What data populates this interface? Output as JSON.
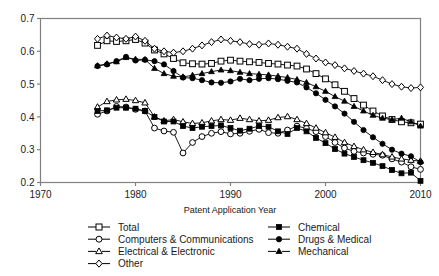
{
  "chart_data": {
    "type": "line",
    "title": "",
    "xlabel": "Patent Application Year",
    "ylabel": "",
    "xlim": [
      1970,
      2010
    ],
    "ylim": [
      0.2,
      0.7
    ],
    "xticks": [
      1970,
      1980,
      1990,
      2000,
      2010
    ],
    "yticks": [
      0.2,
      0.3,
      0.4,
      0.5,
      0.6,
      0.7
    ],
    "xtick_labels": [
      "1970",
      "1980",
      "1990",
      "2000",
      "2010"
    ],
    "ytick_labels": [
      "0.2",
      "0.3",
      "0.4",
      "0.5",
      "0.6",
      "0.7"
    ],
    "grid": false,
    "legend_position": "below",
    "x": [
      1976,
      1977,
      1978,
      1979,
      1980,
      1981,
      1982,
      1983,
      1984,
      1985,
      1986,
      1987,
      1988,
      1989,
      1990,
      1991,
      1992,
      1993,
      1994,
      1995,
      1996,
      1997,
      1998,
      1999,
      2000,
      2001,
      2002,
      2003,
      2004,
      2005,
      2006,
      2007,
      2008,
      2009,
      2010
    ],
    "series": [
      {
        "name": "Total",
        "marker": "open-square",
        "values": [
          0.618,
          0.632,
          0.63,
          0.632,
          0.636,
          0.625,
          0.604,
          0.592,
          0.578,
          0.565,
          0.562,
          0.561,
          0.563,
          0.57,
          0.573,
          0.57,
          0.568,
          0.566,
          0.563,
          0.561,
          0.558,
          0.555,
          0.546,
          0.532,
          0.516,
          0.498,
          0.478,
          0.456,
          0.436,
          0.418,
          0.403,
          0.392,
          0.385,
          0.382,
          0.378
        ]
      },
      {
        "name": "Computers & Communications",
        "marker": "open-circle",
        "values": [
          0.408,
          0.418,
          0.432,
          0.43,
          0.423,
          0.418,
          0.366,
          0.357,
          0.353,
          0.29,
          0.322,
          0.34,
          0.35,
          0.355,
          0.348,
          0.35,
          0.356,
          0.362,
          0.352,
          0.35,
          0.36,
          0.372,
          0.365,
          0.355,
          0.34,
          0.322,
          0.305,
          0.295,
          0.29,
          0.286,
          0.283,
          0.272,
          0.262,
          0.248,
          0.24
        ]
      },
      {
        "name": "Electrical & Electronic",
        "marker": "open-triangle",
        "values": [
          0.43,
          0.447,
          0.452,
          0.454,
          0.45,
          0.443,
          0.4,
          0.388,
          0.392,
          0.385,
          0.38,
          0.382,
          0.388,
          0.392,
          0.39,
          0.396,
          0.392,
          0.388,
          0.39,
          0.398,
          0.401,
          0.392,
          0.38,
          0.366,
          0.352,
          0.338,
          0.322,
          0.31,
          0.3,
          0.292,
          0.285,
          0.278,
          0.272,
          0.268,
          0.265
        ]
      },
      {
        "name": "Other",
        "marker": "open-diamond",
        "values": [
          0.638,
          0.648,
          0.642,
          0.638,
          0.645,
          0.632,
          0.608,
          0.6,
          0.596,
          0.6,
          0.608,
          0.618,
          0.628,
          0.636,
          0.632,
          0.628,
          0.622,
          0.62,
          0.624,
          0.62,
          0.614,
          0.608,
          0.592,
          0.578,
          0.566,
          0.558,
          0.548,
          0.54,
          0.532,
          0.524,
          0.512,
          0.5,
          0.492,
          0.488,
          0.49
        ]
      },
      {
        "name": "Chemical",
        "marker": "filled-square",
        "values": [
          0.418,
          0.42,
          0.428,
          0.428,
          0.425,
          0.418,
          0.4,
          0.386,
          0.386,
          0.372,
          0.366,
          0.37,
          0.372,
          0.374,
          0.366,
          0.358,
          0.364,
          0.372,
          0.37,
          0.356,
          0.348,
          0.366,
          0.356,
          0.336,
          0.32,
          0.302,
          0.288,
          0.278,
          0.268,
          0.26,
          0.25,
          0.238,
          0.228,
          0.23,
          0.205
        ]
      },
      {
        "name": "Drugs & Medical",
        "marker": "filled-circle",
        "values": [
          0.555,
          0.56,
          0.57,
          0.583,
          0.572,
          0.574,
          0.57,
          0.56,
          0.54,
          0.52,
          0.518,
          0.512,
          0.505,
          0.504,
          0.508,
          0.516,
          0.512,
          0.516,
          0.518,
          0.515,
          0.51,
          0.505,
          0.49,
          0.472,
          0.452,
          0.432,
          0.41,
          0.385,
          0.36,
          0.338,
          0.318,
          0.3,
          0.288,
          0.28,
          0.262
        ]
      },
      {
        "name": "Mechanical",
        "marker": "filled-triangle",
        "values": [
          0.556,
          0.562,
          0.568,
          0.581,
          0.576,
          0.575,
          0.548,
          0.532,
          0.524,
          0.522,
          0.527,
          0.532,
          0.538,
          0.543,
          0.541,
          0.536,
          0.532,
          0.53,
          0.528,
          0.524,
          0.52,
          0.514,
          0.505,
          0.492,
          0.478,
          0.462,
          0.448,
          0.432,
          0.418,
          0.405,
          0.396,
          0.392,
          0.396,
          0.385,
          0.372
        ]
      }
    ]
  },
  "legend": {
    "column1": [
      {
        "label": "Total",
        "marker": "open-square"
      },
      {
        "label": "Computers & Communications",
        "marker": "open-circle"
      },
      {
        "label": "Electrical & Electronic",
        "marker": "open-triangle"
      },
      {
        "label": "Other",
        "marker": "open-diamond"
      }
    ],
    "column2": [
      {
        "label": "Chemical",
        "marker": "filled-square"
      },
      {
        "label": "Drugs & Medical",
        "marker": "filled-circle"
      },
      {
        "label": "Mechanical",
        "marker": "filled-triangle"
      }
    ]
  },
  "colors": {
    "line": "#000000",
    "axis": "#808080",
    "text": "#1a1a1a",
    "background": "#ffffff"
  }
}
